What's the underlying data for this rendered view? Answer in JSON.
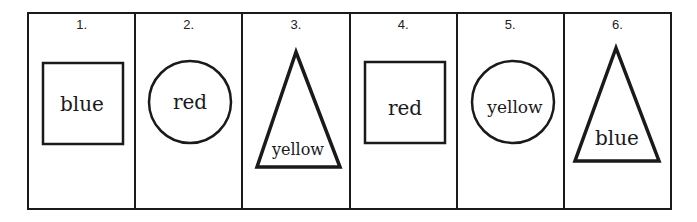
{
  "cells": [
    {
      "number": "1.",
      "shape": "square",
      "word": "blue"
    },
    {
      "number": "2.",
      "shape": "circle",
      "word": "red"
    },
    {
      "number": "3.",
      "shape": "triangle",
      "word": "yellow"
    },
    {
      "number": "4.",
      "shape": "square",
      "word": "red"
    },
    {
      "number": "5.",
      "shape": "circle",
      "word": "yellow"
    },
    {
      "number": "6.",
      "shape": "triangle",
      "word": "blue"
    }
  ],
  "colors": {
    "stroke": "#1a1a1a",
    "background": "#ffffff"
  }
}
